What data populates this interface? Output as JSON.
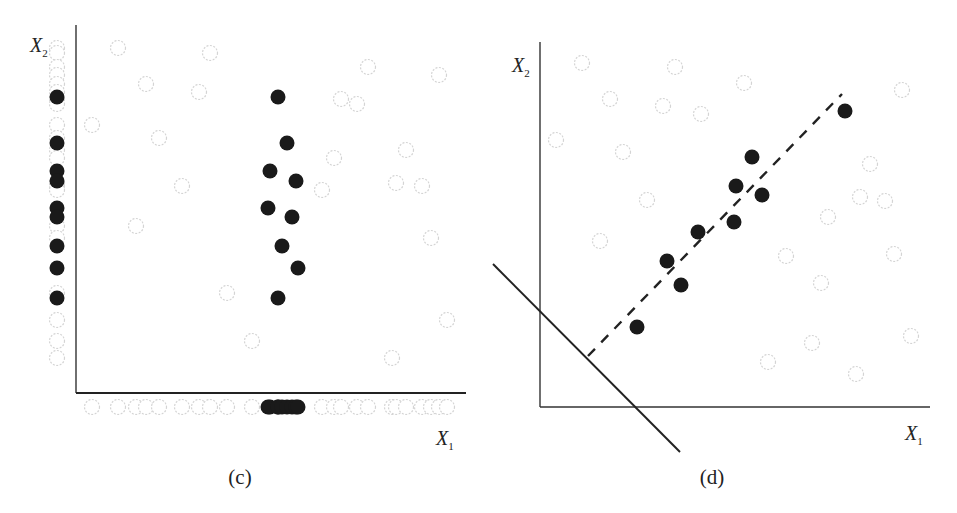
{
  "panels": [
    {
      "id": "c",
      "caption": "(c)",
      "x_axis_label": "X",
      "x_axis_sub": "1",
      "y_axis_label": "X",
      "y_axis_sub": "2",
      "axes": {
        "origin": [
          76,
          393
        ],
        "x_end": 466,
        "y_top": 25
      },
      "dark_points": [
        [
          278,
          97
        ],
        [
          287,
          143
        ],
        [
          270,
          171
        ],
        [
          296,
          181
        ],
        [
          268,
          208
        ],
        [
          292,
          217
        ],
        [
          282,
          246
        ],
        [
          298,
          268
        ],
        [
          278,
          298
        ]
      ],
      "light_points": [
        [
          118,
          48
        ],
        [
          210,
          53
        ],
        [
          146,
          84
        ],
        [
          199,
          92
        ],
        [
          92,
          125
        ],
        [
          159,
          138
        ],
        [
          182,
          186
        ],
        [
          136,
          226
        ],
        [
          227,
          293
        ],
        [
          252,
          341
        ],
        [
          368,
          67
        ],
        [
          439,
          75
        ],
        [
          341,
          99
        ],
        [
          357,
          104
        ],
        [
          406,
          150
        ],
        [
          334,
          158
        ],
        [
          322,
          190
        ],
        [
          396,
          183
        ],
        [
          422,
          186
        ],
        [
          431,
          238
        ],
        [
          447,
          320
        ],
        [
          392,
          358
        ]
      ],
      "projection_x1": {
        "y": 407,
        "light_x": [
          92,
          118,
          136,
          146,
          159,
          182,
          199,
          210,
          227,
          252,
          322,
          334,
          341,
          357,
          368,
          392,
          396,
          406,
          422,
          431,
          439,
          447
        ],
        "dark_x": [
          268,
          270,
          278,
          278,
          282,
          287,
          292,
          296,
          298
        ]
      },
      "projection_x2": {
        "x": 57,
        "light_y": [
          48,
          53,
          67,
          75,
          84,
          92,
          99,
          104,
          125,
          138,
          150,
          158,
          183,
          186,
          190,
          226,
          238,
          293,
          320,
          341,
          358
        ],
        "dark_y": [
          97,
          143,
          171,
          181,
          208,
          217,
          246,
          268,
          298
        ]
      }
    },
    {
      "id": "d",
      "caption": "(d)",
      "x_axis_label": "X",
      "x_axis_sub": "1",
      "y_axis_label": "X",
      "y_axis_sub": "2",
      "axes": {
        "origin": [
          540,
          407
        ],
        "x_end": 930,
        "y_top": 42
      },
      "dark_points": [
        [
          637,
          327
        ],
        [
          667,
          261
        ],
        [
          681,
          285
        ],
        [
          698,
          232
        ],
        [
          734,
          222
        ],
        [
          736,
          186
        ],
        [
          762,
          195
        ],
        [
          752,
          157
        ],
        [
          845,
          111
        ]
      ],
      "light_points": [
        [
          582,
          63
        ],
        [
          675,
          67
        ],
        [
          744,
          83
        ],
        [
          610,
          99
        ],
        [
          663,
          106
        ],
        [
          701,
          114
        ],
        [
          556,
          140
        ],
        [
          623,
          152
        ],
        [
          647,
          200
        ],
        [
          600,
          241
        ],
        [
          902,
          90
        ],
        [
          870,
          164
        ],
        [
          860,
          197
        ],
        [
          885,
          201
        ],
        [
          828,
          217
        ],
        [
          786,
          256
        ],
        [
          894,
          254
        ],
        [
          821,
          283
        ],
        [
          812,
          343
        ],
        [
          911,
          336
        ],
        [
          768,
          362
        ],
        [
          856,
          374
        ]
      ],
      "solid_line": {
        "from": [
          493,
          264
        ],
        "to": [
          680,
          452
        ],
        "description": "projection direction line"
      },
      "dashed_line": {
        "from": [
          588,
          356
        ],
        "to": [
          842,
          94
        ],
        "description": "principal direction of dark class"
      }
    }
  ],
  "colors": {
    "dark_point": "#1a1a1a",
    "light_point_stroke": "#d4d4d4",
    "axis": "#333333"
  }
}
